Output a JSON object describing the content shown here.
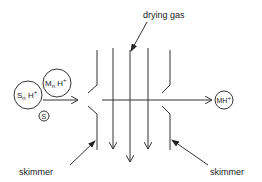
{
  "diagram": {
    "labels": {
      "drying_gas": "drying gas",
      "skimmer_left": "skimmer",
      "skimmer_right": "skimmer"
    },
    "ions": {
      "solvent_cluster": {
        "base": "S",
        "sub": "n",
        "mid": " H",
        "sup": "+"
      },
      "analyte_cluster": {
        "base": "M",
        "sub": "n",
        "mid": " H",
        "sup": "+"
      },
      "solvent": {
        "base": "S"
      },
      "product": {
        "base": "MH",
        "sup": "+"
      }
    },
    "colors": {
      "line": "#333333",
      "text": "#222222",
      "background": "#ffffff"
    }
  }
}
